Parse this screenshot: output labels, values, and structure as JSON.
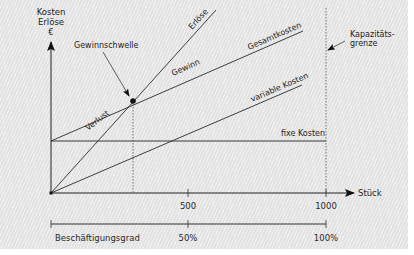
{
  "diagram": {
    "y_axis_label": [
      "Kosten",
      "Erlöse",
      "€"
    ],
    "x_axis_label": "Stück",
    "capacity_label": [
      "Kapazitäts-",
      "grenze"
    ],
    "breakeven_label": "Gewinnschwelle",
    "lines": {
      "revenue": "Erlöse",
      "total_costs": "Gesamtkosten",
      "variable_costs": "variable Kosten",
      "fixed_costs": "fixe Kosten"
    },
    "regions": {
      "profit": "Gewinn",
      "loss": "Verlust"
    },
    "x_ticks": [
      "500",
      "1000"
    ],
    "utilization_axis": {
      "label": "Beschäftigungsgrad",
      "ticks": [
        "50%",
        "100%"
      ]
    },
    "colors": {
      "line": "#2b2b2b",
      "background": "#e9e9e9"
    }
  }
}
